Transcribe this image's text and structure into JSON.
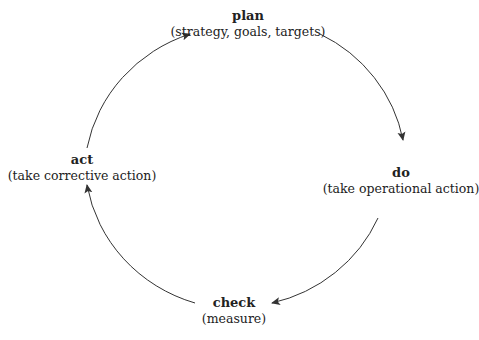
{
  "diagram": {
    "type": "cycle",
    "nodes": [
      {
        "id": "plan",
        "title": "plan",
        "subtitle": "(strategy, goals, targets)"
      },
      {
        "id": "do",
        "title": "do",
        "subtitle": "(take operational action)"
      },
      {
        "id": "check",
        "title": "check",
        "subtitle": "(measure)"
      },
      {
        "id": "act",
        "title": "act",
        "subtitle": "(take corrective action)"
      }
    ],
    "edges": [
      {
        "from": "plan",
        "to": "do"
      },
      {
        "from": "do",
        "to": "check"
      },
      {
        "from": "check",
        "to": "act"
      },
      {
        "from": "act",
        "to": "plan"
      }
    ],
    "colors": {
      "line": "#333333",
      "text": "#222222"
    }
  }
}
